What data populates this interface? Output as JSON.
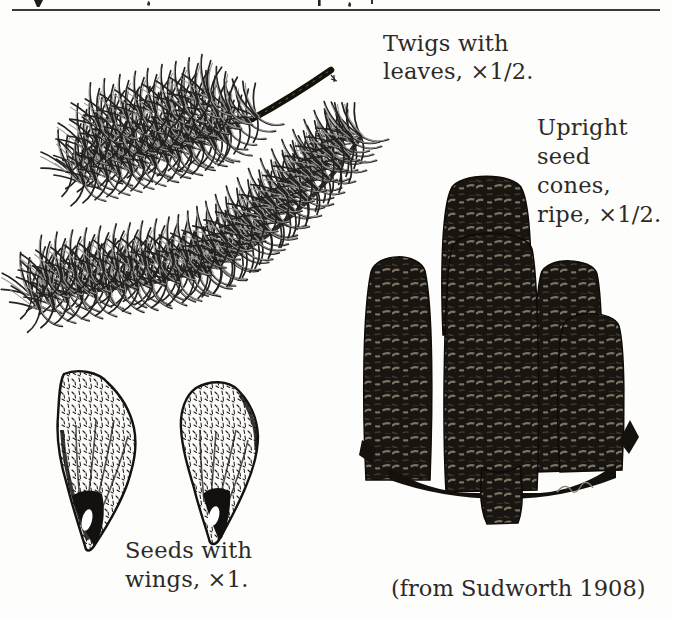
{
  "figure": {
    "twig_caption": {
      "line1": "Twigs with",
      "line2": "leaves, ×1/2."
    },
    "cone_caption": {
      "line1": "Upright",
      "line2": "seed",
      "line3": "cones,",
      "line4": "ripe, ×1/2."
    },
    "seed_caption": {
      "line1": "Seeds with",
      "line2": "wings, ×1."
    },
    "credit": "(from Sudworth 1908)",
    "illustrations": {
      "twigs": "two-fir-twigs-with-dense-needle-leaves",
      "cones": "cluster-of-upright-ripe-seed-cones-on-branch",
      "seeds": "pair-of-winged-seeds"
    }
  }
}
